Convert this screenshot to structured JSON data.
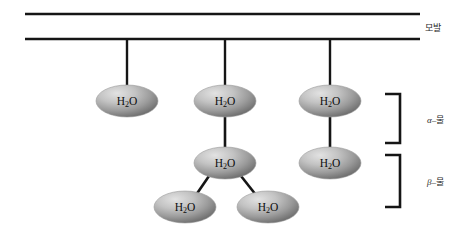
{
  "figure": {
    "type": "diagram",
    "background_color": "#ffffff",
    "line_color": "#151515",
    "molecule_fill_light": "#d8d8d8",
    "molecule_fill_dark": "#6f6f6f"
  },
  "hair": {
    "label": "모발",
    "line_count": 2
  },
  "molecules": [
    {
      "id": "a1",
      "label_main": "H",
      "label_sub": "2",
      "label_tail": "O",
      "cx": 127,
      "cy": 101,
      "rx": 31,
      "ry": 16
    },
    {
      "id": "a2",
      "label_main": "H",
      "label_sub": "2",
      "label_tail": "O",
      "cx": 225,
      "cy": 101,
      "rx": 31,
      "ry": 16
    },
    {
      "id": "a3",
      "label_main": "H",
      "label_sub": "2",
      "label_tail": "O",
      "cx": 330,
      "cy": 101,
      "rx": 31,
      "ry": 16
    },
    {
      "id": "b1",
      "label_main": "H",
      "label_sub": "2",
      "label_tail": "O",
      "cx": 225,
      "cy": 163,
      "rx": 31,
      "ry": 16
    },
    {
      "id": "b2",
      "label_main": "H",
      "label_sub": "2",
      "label_tail": "O",
      "cx": 330,
      "cy": 163,
      "rx": 31,
      "ry": 16
    },
    {
      "id": "b3",
      "label_main": "H",
      "label_sub": "2",
      "label_tail": "O",
      "cx": 185,
      "cy": 207,
      "rx": 31,
      "ry": 16
    },
    {
      "id": "b4",
      "label_main": "H",
      "label_sub": "2",
      "label_tail": "O",
      "cx": 268,
      "cy": 207,
      "rx": 31,
      "ry": 16
    }
  ],
  "phases": [
    {
      "id": "alpha",
      "greek": "α",
      "dash": "–",
      "korean": "물",
      "bracket_top": 94,
      "bracket_bottom": 143
    },
    {
      "id": "beta",
      "greek": "β",
      "dash": "–",
      "korean": "물",
      "bracket_top": 155,
      "bracket_bottom": 207
    }
  ]
}
